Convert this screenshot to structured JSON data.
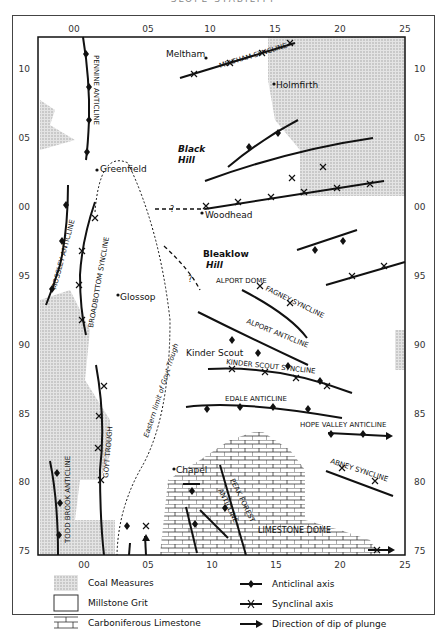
{
  "title_clipped": "SLOPE STABILITY",
  "axes": {
    "x_ticks": [
      "00",
      "05",
      "10",
      "15",
      "20",
      "25"
    ],
    "y_ticks": [
      "10",
      "05",
      "00",
      "95",
      "90",
      "85",
      "80",
      "75"
    ]
  },
  "places": {
    "meltham": "Meltham",
    "holmfirth": "Holmfirth",
    "black_hill_1": "Black",
    "black_hill_2": "Hill",
    "greenfield": "Greenfield",
    "woodhead": "Woodhead",
    "bleaklow_1": "Bleaklow",
    "bleaklow_2": "Hill",
    "glossop": "Glossop",
    "kinder_scout": "Kinder Scout",
    "chapel": "Chapel"
  },
  "structures": {
    "pennine_anticline": "PENNINE ANTICLINE",
    "meltham_syncline": "MELTHAM SYNCLINE",
    "mossley_anticline": "MOSSLEY ANTICLINE",
    "broadbottom_syncline": "BROADBOTTOM SYNCLINE",
    "alport_dome": "ALPORT DOME",
    "fagney_syncline": "FAGNEY SYNCLINE",
    "alport_anticline": "ALPORT ANTICLINE",
    "kinder_scout_syncline": "KINDER SCOUT SYNCLINE",
    "edale_anticline": "EDALE ANTICLINE",
    "hope_valley_anticline": "HOPE VALLEY ANTICLINE",
    "abney_syncline": "ABNEY SYNCLINE",
    "goyt_trough": "GOYT TROUGH",
    "todd_brook_anticline": "TODD BROOK ANTICLINE",
    "peak_forest_1": "PEAK FOREST",
    "peak_forest_2": "ANTICLINE",
    "limestone_dome": "LIMESTONE DOME",
    "eastern_limit": "Eastern limit of Goyt Trough",
    "question": "?"
  },
  "legend": {
    "coal_measures": "Coal Measures",
    "millstone_grit": "Millstone Grit",
    "carboniferous_limestone": "Carboniferous Limestone",
    "anticlinal_axis": "Anticlinal axis",
    "synclinal_axis": "Synclinal axis",
    "plunge": "Direction of dip of plunge"
  },
  "colors": {
    "ink": "#111111",
    "coal_fill": "#c8c8c8",
    "paper": "#ffffff"
  }
}
